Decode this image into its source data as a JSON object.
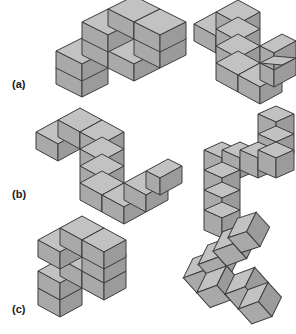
{
  "figure": {
    "title": "",
    "background_color": "#ffffff",
    "cube_colors": {
      "top_face": "#c2c2c2",
      "left_face": "#a9a9a9",
      "right_face": "#9b9b9b",
      "edge_stroke": "#3d3d3d"
    },
    "rows": [
      {
        "id": "a",
        "label": "(a)",
        "label_x": 12,
        "label_y": 78,
        "pairs": [
          {
            "name": "row-a-left-shape",
            "x": 46,
            "y": 8,
            "scale": 1.0,
            "view": "isometric-standard",
            "projection": {
              "ax": 26,
              "ay": -13,
              "bx": 26,
              "by": 13,
              "cx": 0,
              "cy": -29
            },
            "origin": {
              "x": 4,
              "y": 56
            },
            "cubes": [
              [
                0,
                0,
                0
              ],
              [
                1,
                0,
                0
              ],
              [
                2,
                0,
                0
              ],
              [
                3,
                0,
                0
              ],
              [
                0,
                0,
                -1
              ],
              [
                3,
                0,
                1
              ],
              [
                3,
                0,
                2
              ]
            ],
            "cube_count": 7,
            "description": "zig-zag arm of 7 cubes, left side view"
          },
          {
            "name": "row-a-right-shape",
            "x": 190,
            "y": 8,
            "scale": 1.0,
            "view": "isometric-rotated",
            "projection": {
              "ax": 24,
              "ay": 12,
              "bx": -24,
              "by": 12,
              "cx": 0,
              "cy": -27
            },
            "origin": {
              "x": 52,
              "y": 34
            },
            "cubes": [
              [
                0,
                0,
                0
              ],
              [
                0,
                1,
                0
              ],
              [
                0,
                2,
                0
              ],
              [
                0,
                0,
                1
              ],
              [
                0,
                0,
                2
              ],
              [
                1,
                0,
                0
              ],
              [
                2,
                0,
                0
              ]
            ],
            "cube_count": 7,
            "description": "same shape rotated, U-like with two prongs"
          }
        ]
      },
      {
        "id": "b",
        "label": "(b)",
        "label_x": 12,
        "label_y": 188,
        "pairs": [
          {
            "name": "row-b-left-shape",
            "x": 36,
            "y": 116,
            "scale": 1.0,
            "view": "isometric-standard",
            "projection": {
              "ax": 26,
              "ay": -13,
              "bx": 26,
              "by": 13,
              "cx": 0,
              "cy": -29
            },
            "origin": {
              "x": 4,
              "y": 56
            },
            "cubes": [
              [
                0,
                0,
                0
              ],
              [
                1,
                0,
                0
              ],
              [
                2,
                0,
                0
              ],
              [
                3,
                0,
                0
              ],
              [
                0,
                0,
                1
              ],
              [
                0,
                0,
                2
              ],
              [
                0,
                0,
                3
              ]
            ],
            "cube_count": 7,
            "description": "L / hook of 7 cubes descending then along"
          },
          {
            "name": "row-b-right-shape",
            "x": 192,
            "y": 108,
            "scale": 1.0,
            "view": "isometric-rotated",
            "projection": {
              "ax": 22,
              "ay": 11,
              "bx": -22,
              "by": 11,
              "cx": 0,
              "cy": -27
            },
            "origin": {
              "x": 46,
              "y": 40
            },
            "cubes": [
              [
                0,
                0,
                0
              ],
              [
                0,
                1,
                0
              ],
              [
                0,
                2,
                0
              ],
              [
                0,
                3,
                0
              ],
              [
                1,
                0,
                0
              ],
              [
                2,
                0,
                0
              ],
              [
                3,
                0,
                0
              ]
            ],
            "cube_count": 7,
            "description": "mirrored hook, vertical column plus horizontal run"
          }
        ]
      },
      {
        "id": "c",
        "label": "(c)",
        "label_x": 12,
        "label_y": 303,
        "pairs": [
          {
            "name": "row-c-left-shape",
            "x": 36,
            "y": 224,
            "scale": 1.0,
            "view": "isometric-standard",
            "projection": {
              "ax": 26,
              "ay": -13,
              "bx": 26,
              "by": 13,
              "cx": 0,
              "cy": -29
            },
            "origin": {
              "x": 4,
              "y": 56
            },
            "cubes": [
              [
                0,
                0,
                0
              ],
              [
                1,
                0,
                0
              ],
              [
                2,
                0,
                0
              ],
              [
                3,
                0,
                0
              ],
              [
                0,
                0,
                -1
              ],
              [
                3,
                0,
                1
              ],
              [
                3,
                0,
                2
              ]
            ],
            "cube_count": 7,
            "description": "zig-zag arm of 7 cubes, identical to row a left"
          },
          {
            "name": "row-c-right-shape",
            "x": 182,
            "y": 220,
            "scale": 1.0,
            "view": "isometric-tilted",
            "projection": {
              "ax": 22,
              "ay": 22,
              "bx": 22,
              "by": -22,
              "cx": 8,
              "cy": 4
            },
            "origin": {
              "x": 60,
              "y": 50
            },
            "cubes": [
              [
                0,
                0,
                0
              ],
              [
                1,
                0,
                0
              ],
              [
                2,
                0,
                0
              ],
              [
                3,
                0,
                0
              ],
              [
                0,
                1,
                0
              ],
              [
                0,
                2,
                0
              ],
              [
                3,
                -1,
                0
              ]
            ],
            "cube_count": 7,
            "description": "tilted chevron / arrow shape viewed near top-down"
          }
        ]
      }
    ]
  }
}
